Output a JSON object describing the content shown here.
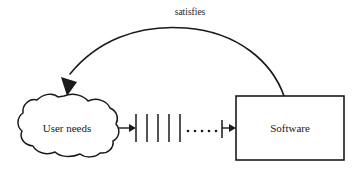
{
  "diagram": {
    "background_color": "#ffffff",
    "stroke_color": "#1a1a1a",
    "nodes": {
      "cloud": {
        "label": "User needs",
        "shape": "cloud",
        "center_x": 67,
        "center_y": 128
      },
      "box": {
        "label": "Software",
        "shape": "rectangle",
        "x": 236,
        "y": 96,
        "width": 108,
        "height": 64,
        "center_x": 290,
        "center_y": 128
      }
    },
    "edges": {
      "satisfies": {
        "label": "satisfies",
        "label_x": 190,
        "label_y": 13,
        "from": "Software",
        "to": "User needs",
        "style": "curved-arc",
        "arrowhead": "filled"
      },
      "process": {
        "from": "User needs",
        "to": "Software",
        "style": "tick-timeline",
        "arrowhead": "filled"
      }
    },
    "timeline": {
      "start_x": 136,
      "tick_count": 5,
      "tick_positions": [
        136,
        147,
        158,
        169,
        180
      ],
      "tick_top": 114,
      "tick_bottom": 142,
      "dot_count": 5,
      "dot_positions": [
        188,
        195,
        202,
        209,
        216
      ],
      "dot_y": 131,
      "end_bar_x": 222,
      "end_bar_top": 120,
      "end_bar_bottom": 138
    }
  }
}
